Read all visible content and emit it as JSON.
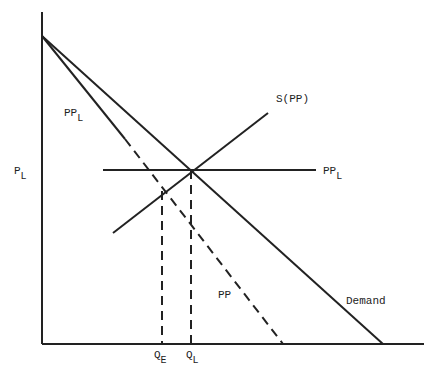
{
  "diagram": {
    "type": "economics supply-demand diagram",
    "colors": {
      "ink": "#222222",
      "background": "#ffffff"
    },
    "axes": {
      "y_axis": {
        "x": 42,
        "y1": 12,
        "y2": 344
      },
      "x_axis": {
        "y": 344,
        "x1": 42,
        "x2": 424
      }
    },
    "curves": {
      "demand": {
        "x1": 42,
        "y1": 36,
        "x2": 383,
        "y2": 344,
        "style": "solid"
      },
      "pp_solid": {
        "x1": 42,
        "y1": 36,
        "x2": 125,
        "y2": 139,
        "style": "solid"
      },
      "pp_dashed": {
        "x1": 125,
        "y1": 139,
        "x2": 283,
        "y2": 344,
        "style": "dashed"
      },
      "ppl_horizontal": {
        "x1": 103,
        "y1": 170,
        "x2": 316,
        "y2": 170,
        "style": "solid"
      },
      "supply": {
        "x1": 113,
        "y1": 233,
        "x2": 268,
        "y2": 113,
        "style": "solid"
      },
      "ql_drop": {
        "x1": 191,
        "y1": 170,
        "x2": 191,
        "y2": 344,
        "style": "dashed"
      },
      "qe_drop": {
        "x1": 162,
        "y1": 191,
        "x2": 162,
        "y2": 344,
        "style": "dashed"
      }
    },
    "labels": {
      "supply": {
        "main": "S(PP)",
        "sub": ""
      },
      "ppl_right": {
        "main": "PP",
        "sub": "L"
      },
      "ppl_left": {
        "main": "PP",
        "sub": "L"
      },
      "price_axis": {
        "main": "P",
        "sub": "L"
      },
      "pp": {
        "main": "PP",
        "sub": ""
      },
      "demand": {
        "main": "Demand",
        "sub": ""
      },
      "qe": {
        "main": "Q",
        "sub": "E"
      },
      "ql": {
        "main": "Q",
        "sub": "L"
      }
    }
  }
}
